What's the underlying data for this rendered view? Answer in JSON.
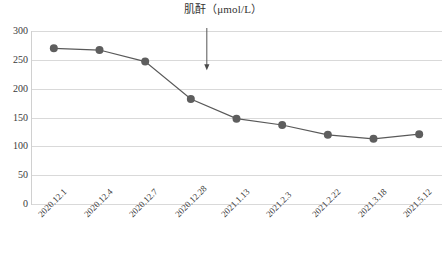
{
  "chart_data": {
    "type": "line",
    "title": "肌酐（μmol/L）",
    "xlabel": "",
    "ylabel": "",
    "categories": [
      "2020.12.1",
      "2020.12.4",
      "2020.12.7",
      "2020.12.28",
      "2021.1.13",
      "2021.2.3",
      "2021.2.22",
      "2021.3.18",
      "2021.5.12"
    ],
    "values": [
      270,
      267,
      247,
      182,
      148,
      137,
      120,
      113,
      121
    ],
    "series": [
      {
        "name": "肌酐",
        "values": [
          270,
          267,
          247,
          182,
          148,
          137,
          120,
          113,
          121
        ]
      }
    ],
    "ylim": [
      0,
      300
    ],
    "yticks": [
      0,
      50,
      100,
      150,
      200,
      250,
      300
    ],
    "ytick_labels": [
      "0",
      "50",
      "100",
      "150",
      "200",
      "250",
      "300"
    ],
    "grid": "horizontal",
    "legend": "none",
    "line_color": "#595959",
    "marker_color": "#5e5e5e",
    "gridline_color": "#d9d9d9",
    "annotations": [
      {
        "name": "treatment-start-arrow",
        "type": "down-arrow",
        "x_value": 3.35,
        "y_top": 300,
        "y_tip": 232,
        "label": ""
      }
    ]
  }
}
